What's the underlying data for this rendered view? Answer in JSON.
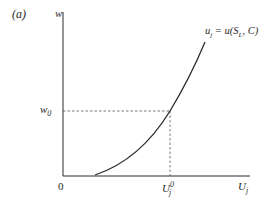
{
  "panel_label": "(a)",
  "y_axis": {
    "label": "w"
  },
  "x_axis": {
    "label_main": "U",
    "label_sub": "j",
    "origin_label": "0"
  },
  "reference_y": {
    "label_main": "w",
    "label_sub": "0"
  },
  "reference_x": {
    "label_main": "U",
    "label_sub": "j",
    "label_sup": "0"
  },
  "curve": {
    "label_lhs_main": "u",
    "label_lhs_sub": "j",
    "label_eq": " = u(S",
    "label_S_sub": "L",
    "label_rest": ", C)"
  },
  "colors": {
    "ink": "#2a2a2a",
    "dash": "#555555"
  }
}
